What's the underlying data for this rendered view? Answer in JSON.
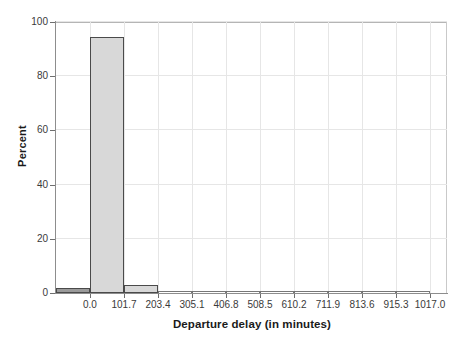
{
  "chart_data": {
    "type": "bar",
    "title": "",
    "xlabel": "Departure delay (in minutes)",
    "ylabel": "Percent",
    "xlim": [
      -101.7,
      1068.0
    ],
    "ylim": [
      0,
      100
    ],
    "xticks": [
      "0.0",
      "101.7",
      "203.4",
      "305.1",
      "406.8",
      "508.5",
      "610.2",
      "711.9",
      "813.6",
      "915.3",
      "1017.0"
    ],
    "xtick_values": [
      0.0,
      101.7,
      203.4,
      305.1,
      406.8,
      508.5,
      610.2,
      711.9,
      813.6,
      915.3,
      1017.0
    ],
    "yticks": [
      "0",
      "20",
      "40",
      "60",
      "80",
      "100"
    ],
    "ytick_values": [
      0,
      20,
      40,
      60,
      80,
      100
    ],
    "grid": true,
    "legend": "none",
    "bin_width": 101.7,
    "bins": [
      {
        "left": -101.7,
        "right": 0.0,
        "percent": 2.0
      },
      {
        "left": 0.0,
        "right": 101.7,
        "percent": 94.6
      },
      {
        "left": 101.7,
        "right": 203.4,
        "percent": 2.8
      },
      {
        "left": 203.4,
        "right": 305.1,
        "percent": 0.35
      },
      {
        "left": 305.1,
        "right": 406.8,
        "percent": 0.12
      },
      {
        "left": 406.8,
        "right": 508.5,
        "percent": 0.07
      },
      {
        "left": 508.5,
        "right": 610.2,
        "percent": 0.04
      },
      {
        "left": 610.2,
        "right": 711.9,
        "percent": 0.03
      },
      {
        "left": 711.9,
        "right": 813.6,
        "percent": 0.02
      },
      {
        "left": 813.6,
        "right": 915.3,
        "percent": 0.02
      },
      {
        "left": 915.3,
        "right": 1017.0,
        "percent": 0.02
      }
    ],
    "categories": [
      "-101.7 to 0.0",
      "0.0 to 101.7",
      "101.7 to 203.4",
      "203.4 to 305.1",
      "305.1 to 406.8",
      "406.8 to 508.5",
      "508.5 to 610.2",
      "610.2 to 711.9",
      "711.9 to 813.6",
      "813.6 to 915.3",
      "915.3 to 1017.0"
    ],
    "values": [
      2.0,
      94.6,
      2.8,
      0.35,
      0.12,
      0.07,
      0.04,
      0.03,
      0.02,
      0.02,
      0.02
    ],
    "colors": {
      "bar_fill": "#d8d8d8",
      "bar_edge": "#4a4a4a",
      "bar_fill_first": "#9a9a9a",
      "grid": "#e6e6e6",
      "axis": "#8d8d8d",
      "text": "#1a1a1a",
      "background": "#ffffff"
    }
  }
}
